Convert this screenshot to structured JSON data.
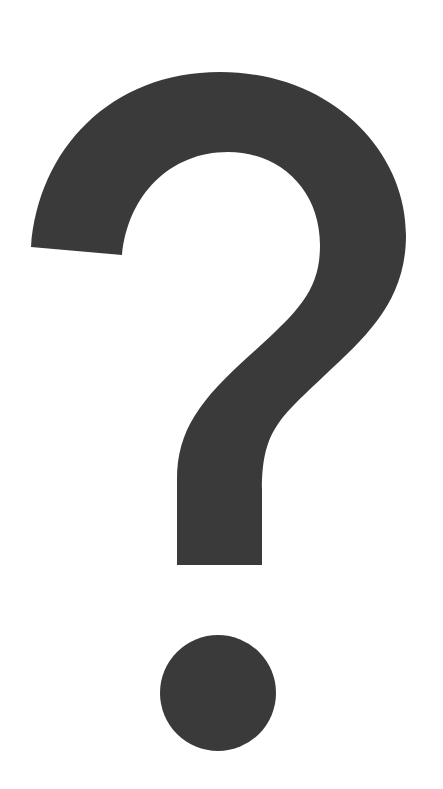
{
  "image": {
    "subject": "question mark",
    "background_color": "#ffffff",
    "glyph_color": "#3a3a3a"
  },
  "icon": {
    "name": "question-mark-icon"
  }
}
